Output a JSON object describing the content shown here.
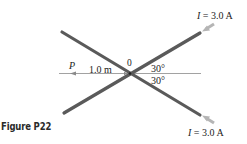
{
  "figure": {
    "caption": "Figure P22",
    "labels": {
      "point": "P",
      "distance": "1.0 m",
      "origin": "0",
      "angle_upper": "30°",
      "angle_lower": "30°",
      "current_upper_symbol": "I",
      "current_upper_value": " = 3.0 A",
      "current_lower_symbol": "I",
      "current_lower_value": " = 3.0 A"
    },
    "colors": {
      "wire": "#5a5a5a",
      "axis": "#8a8a8a",
      "arrow": "#b5b5b5",
      "text": "#222222"
    }
  }
}
